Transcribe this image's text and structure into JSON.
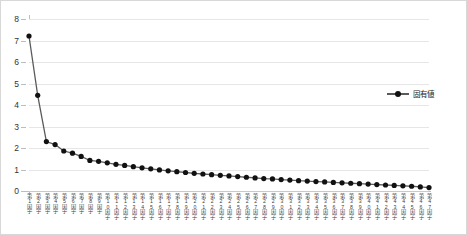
{
  "chart_data": {
    "type": "line",
    "title": "",
    "xlabel": "",
    "ylabel": "",
    "ylim": [
      0,
      8
    ],
    "ytick_values": [
      0,
      1,
      2,
      3,
      4,
      5,
      6,
      7,
      8
    ],
    "ytick_labels": [
      "0",
      "1",
      "2",
      "3",
      "4",
      "5",
      "6",
      "7",
      "8"
    ],
    "grid": true,
    "legend_position": "right",
    "legend_entries": [
      "固有値"
    ],
    "category_prefix": "第",
    "category_suffix": "因子",
    "categories": [
      "第1因子",
      "第2因子",
      "第3因子",
      "第4因子",
      "第5因子",
      "第6因子",
      "第7因子",
      "第8因子",
      "第9因子",
      "第10因子",
      "第11因子",
      "第12因子",
      "第13因子",
      "第14因子",
      "第15因子",
      "第16因子",
      "第17因子",
      "第18因子",
      "第19因子",
      "第20因子",
      "第21因子",
      "第22因子",
      "第23因子",
      "第24因子",
      "第25因子",
      "第26因子",
      "第27因子",
      "第28因子",
      "第29因子",
      "第30因子",
      "第31因子",
      "第32因子",
      "第33因子",
      "第34因子",
      "第35因子",
      "第36因子",
      "第37因子",
      "第38因子",
      "第39因子",
      "第40因子",
      "第41因子",
      "第42因子",
      "第43因子",
      "第44因子",
      "第45因子",
      "第46因子",
      "第47因子"
    ],
    "series": [
      {
        "name": "固有値",
        "color": "#111111",
        "line_color": "#5a5a5a",
        "values": [
          7.21,
          4.45,
          2.3,
          2.16,
          1.86,
          1.76,
          1.61,
          1.42,
          1.38,
          1.31,
          1.24,
          1.19,
          1.13,
          1.08,
          1.03,
          0.98,
          0.94,
          0.9,
          0.86,
          0.82,
          0.79,
          0.76,
          0.73,
          0.7,
          0.67,
          0.64,
          0.61,
          0.58,
          0.56,
          0.53,
          0.51,
          0.48,
          0.46,
          0.44,
          0.42,
          0.4,
          0.38,
          0.36,
          0.34,
          0.32,
          0.3,
          0.28,
          0.26,
          0.24,
          0.22,
          0.19,
          0.16
        ]
      }
    ]
  },
  "colors": {
    "grid": "#e6e6e6",
    "axis": "#bdbdbd",
    "marker": "#111111",
    "line": "#5a5a5a",
    "border": "#d8d8d8",
    "text": "#333333"
  }
}
